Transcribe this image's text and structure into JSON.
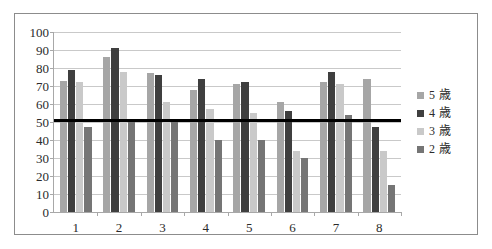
{
  "chart_data": {
    "type": "bar",
    "title": "",
    "subtitle": "",
    "xlabel": "",
    "ylabel": "",
    "categories": [
      "1",
      "2",
      "3",
      "4",
      "5",
      "6",
      "7",
      "8"
    ],
    "series": [
      {
        "name": "5 歳",
        "color": "#a6a6a6",
        "values": [
          73,
          86,
          77,
          68,
          71,
          61,
          72,
          74
        ]
      },
      {
        "name": "4 歳",
        "color": "#3f3f3f",
        "values": [
          79,
          91,
          76,
          74,
          72,
          56,
          78,
          47
        ]
      },
      {
        "name": "3 歳",
        "color": "#c9c9c9",
        "values": [
          72,
          78,
          61,
          57,
          55,
          34,
          71,
          34
        ]
      },
      {
        "name": "2 歳",
        "color": "#757575",
        "values": [
          47,
          51,
          51,
          40,
          40,
          30,
          54,
          15
        ]
      }
    ],
    "ylim": [
      0,
      100
    ],
    "ytick_step": 10,
    "yticks": [
      "100",
      "90",
      "80",
      "70",
      "60",
      "50",
      "40",
      "30",
      "20",
      "10",
      "0"
    ],
    "grid": true,
    "legend_position": "right",
    "annotations": [
      {
        "type": "hline",
        "value": 51,
        "color": "#000000",
        "label": ""
      }
    ]
  },
  "legend": {
    "items": [
      {
        "label": "5 歳",
        "color": "#a6a6a6"
      },
      {
        "label": "4 歳",
        "color": "#3f3f3f"
      },
      {
        "label": "3 歳",
        "color": "#c9c9c9"
      },
      {
        "label": "2 歳",
        "color": "#757575"
      }
    ]
  },
  "colors": {
    "border": "#8c8c8c",
    "axis": "#a8a8a8",
    "grid": "#c9c9c9",
    "threshold": "#000000",
    "text": "#2b2b2b",
    "background": "#ffffff"
  }
}
